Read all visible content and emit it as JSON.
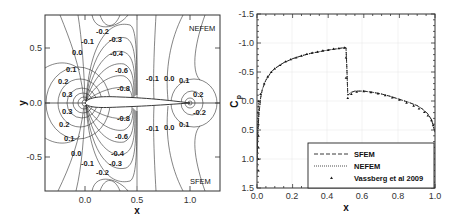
{
  "chart_data": [
    {
      "type": "contour",
      "title": "",
      "xlabel": "x",
      "ylabel": "y",
      "xlim": [
        -0.38,
        1.3
      ],
      "ylim": [
        -0.82,
        0.82
      ],
      "x_ticks": [
        "0.0",
        "0.5",
        "1.0"
      ],
      "y_ticks": [
        "0.5",
        "0.0",
        "-0.5"
      ],
      "annotations": {
        "top_right": "NEFEM",
        "bottom_right": "SFEM"
      },
      "contour_labels_upper": [
        "-0.2",
        "-0.1",
        "-0.3",
        "0.0",
        "-0.4",
        "0.1",
        "-0.6",
        "0.2",
        "-0.8",
        "0.3",
        "-0.1",
        "0.0",
        "0.1",
        "0.2"
      ],
      "contour_labels_lower": [
        "0.3",
        "0.2",
        "0.1",
        "0.0",
        "-0.1",
        "-0.2",
        "-0.3",
        "-0.4",
        "-0.6",
        "-0.8",
        "-0.1",
        "0.0",
        "0.1",
        "-0.2"
      ]
    },
    {
      "type": "line",
      "title": "",
      "xlabel": "x",
      "ylabel": "Cp",
      "xlim": [
        0.0,
        1.0
      ],
      "ylim": [
        1.5,
        -1.5
      ],
      "y_inverted": true,
      "grid": true,
      "x_ticks": [
        "0.0",
        "0.2",
        "0.4",
        "0.6",
        "0.8",
        "1.0"
      ],
      "y_ticks": [
        "-1.5",
        "-1.0",
        "-0.5",
        "0.0",
        "0.5",
        "1.0",
        "1.5"
      ],
      "legend_position": "lower right",
      "series": [
        {
          "name": "SFEM",
          "style": "dashed",
          "x": [
            0.0,
            0.005,
            0.01,
            0.02,
            0.03,
            0.05,
            0.08,
            0.1,
            0.15,
            0.2,
            0.25,
            0.3,
            0.35,
            0.4,
            0.45,
            0.49,
            0.5,
            0.505,
            0.51,
            0.53,
            0.55,
            0.6,
            0.65,
            0.7,
            0.75,
            0.8,
            0.85,
            0.9,
            0.93,
            0.96,
            0.98,
            0.99,
            1.0
          ],
          "y": [
            1.0,
            0.55,
            0.25,
            -0.05,
            -0.2,
            -0.36,
            -0.5,
            -0.56,
            -0.66,
            -0.73,
            -0.78,
            -0.82,
            -0.85,
            -0.88,
            -0.9,
            -0.92,
            -0.92,
            -0.55,
            -0.1,
            -0.15,
            -0.17,
            -0.17,
            -0.15,
            -0.12,
            -0.08,
            -0.03,
            0.02,
            0.08,
            0.14,
            0.22,
            0.32,
            0.42,
            0.55
          ]
        },
        {
          "name": "NEFEM",
          "style": "dotted",
          "x": [
            0.0,
            0.005,
            0.01,
            0.02,
            0.03,
            0.05,
            0.08,
            0.1,
            0.15,
            0.2,
            0.25,
            0.3,
            0.35,
            0.4,
            0.45,
            0.49,
            0.5,
            0.505,
            0.51,
            0.53,
            0.55,
            0.6,
            0.65,
            0.7,
            0.75,
            0.8,
            0.85,
            0.9,
            0.93,
            0.96,
            0.98,
            0.99,
            1.0
          ],
          "y": [
            1.0,
            0.55,
            0.25,
            -0.05,
            -0.2,
            -0.36,
            -0.5,
            -0.56,
            -0.66,
            -0.73,
            -0.78,
            -0.82,
            -0.85,
            -0.88,
            -0.9,
            -0.92,
            -0.92,
            -0.55,
            -0.1,
            -0.15,
            -0.17,
            -0.17,
            -0.15,
            -0.12,
            -0.08,
            -0.03,
            0.02,
            0.08,
            0.14,
            0.22,
            0.32,
            0.42,
            0.55
          ]
        },
        {
          "name": "Vassberg et al 2009",
          "style": "markers",
          "x": [
            0.0,
            0.0,
            0.0,
            0.0,
            0.0,
            0.005,
            0.01,
            0.02,
            0.04,
            0.06,
            0.08,
            0.1,
            0.13,
            0.16,
            0.19,
            0.22,
            0.25,
            0.28,
            0.31,
            0.34,
            0.37,
            0.4,
            0.43,
            0.46,
            0.49,
            0.5,
            0.5,
            0.51,
            0.53,
            0.56,
            0.6,
            0.64,
            0.68,
            0.72,
            0.76,
            0.8,
            0.84,
            0.88,
            0.91,
            0.94,
            0.96,
            0.98,
            0.99
          ],
          "y": [
            1.2,
            1.0,
            0.8,
            0.6,
            0.4,
            0.2,
            0.0,
            -0.12,
            -0.3,
            -0.42,
            -0.5,
            -0.56,
            -0.62,
            -0.68,
            -0.72,
            -0.75,
            -0.78,
            -0.81,
            -0.83,
            -0.85,
            -0.87,
            -0.88,
            -0.9,
            -0.91,
            -0.92,
            -0.75,
            -0.4,
            -0.05,
            -0.12,
            -0.16,
            -0.17,
            -0.15,
            -0.13,
            -0.1,
            -0.06,
            -0.02,
            0.03,
            0.08,
            0.13,
            0.19,
            0.25,
            0.33,
            0.42
          ]
        }
      ]
    }
  ],
  "left_plot": {
    "xlabel": "x",
    "ylabel": "y",
    "xticks": [
      "0.0",
      "0.5",
      "1.0"
    ],
    "yticks": [
      "0.5",
      "0.0",
      "-0.5"
    ],
    "label_nefem": "NEFEM",
    "label_sfem": "SFEM"
  },
  "right_plot": {
    "xlabel": "x",
    "ylabel": "C",
    "ylabel_sub": "p",
    "xticks": [
      "0.0",
      "0.2",
      "0.4",
      "0.6",
      "0.8",
      "1.0"
    ],
    "yticks": [
      "-1.5",
      "-1.0",
      "-0.5",
      "0.0",
      "0.5",
      "1.0",
      "1.5"
    ],
    "legend": [
      "SFEM",
      "NEFEM",
      "Vassberg et al 2009"
    ]
  }
}
